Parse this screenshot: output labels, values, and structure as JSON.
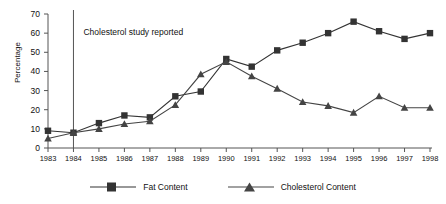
{
  "chart_data": {
    "type": "line",
    "title": "",
    "xlabel": "",
    "ylabel": "Percentage",
    "ylim": [
      0,
      70
    ],
    "ytick_values": [
      0,
      10,
      20,
      30,
      40,
      50,
      60,
      70
    ],
    "ytick_labels": [
      "0",
      "10",
      "20",
      "30",
      "40",
      "50",
      "60",
      "70"
    ],
    "grid": false,
    "legend_position": "bottom",
    "categories": [
      "1983",
      "1984",
      "1985",
      "1986",
      "1987",
      "1988",
      "1989",
      "1990",
      "1991",
      "1992",
      "1993",
      "1994",
      "1995",
      "1996",
      "1997",
      "1998"
    ],
    "series": [
      {
        "name": "Fat Content",
        "marker": "square",
        "color": "#333333",
        "values": [
          9,
          8,
          13,
          17,
          16,
          27,
          29.5,
          46.5,
          42.5,
          51,
          55,
          60,
          66,
          61,
          57,
          60
        ]
      },
      {
        "name": "Cholesterol Content",
        "marker": "triangle",
        "color": "#444444",
        "values": [
          5,
          8,
          10,
          12.5,
          14,
          22.5,
          38.5,
          45,
          37.5,
          31,
          24,
          22,
          18.5,
          27,
          21,
          21
        ]
      }
    ],
    "annotations": [
      {
        "name": "cholesterol-study-marker",
        "text": "Cholesterol study reported",
        "at_category": "1984",
        "line": "vertical"
      }
    ]
  },
  "legend": {
    "items": [
      {
        "label": "Fat Content",
        "marker": "square"
      },
      {
        "label": "Cholesterol Content",
        "marker": "triangle"
      }
    ]
  },
  "axes": {
    "y_title": "Percentage"
  }
}
